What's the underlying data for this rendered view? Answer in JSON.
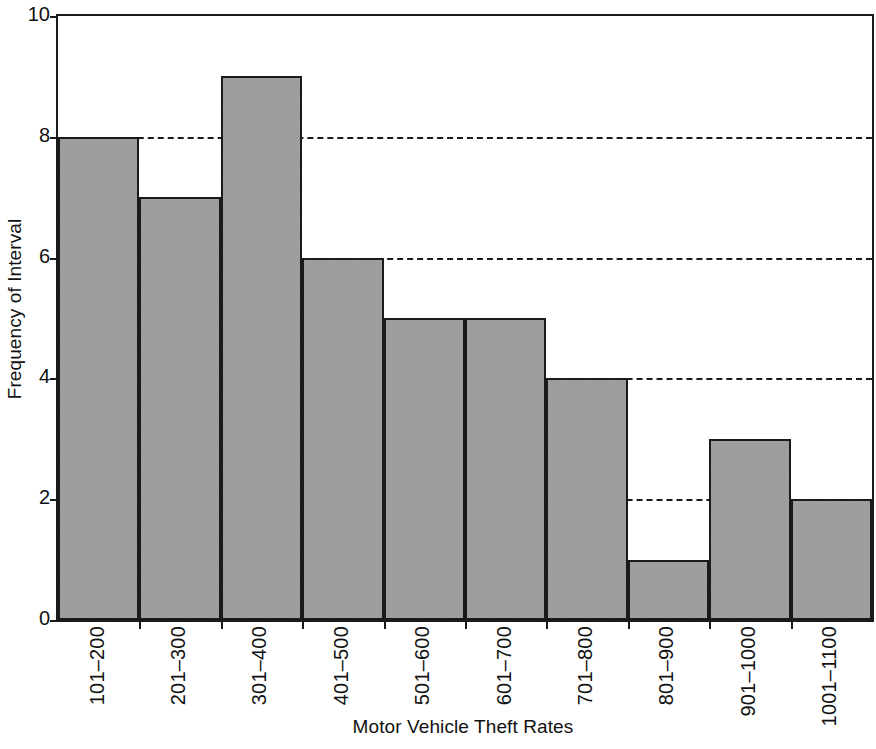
{
  "chart_data": {
    "type": "bar",
    "title": "",
    "subtitle": "",
    "xlabel": "Motor Vehicle Theft Rates",
    "ylabel": "Frequency of Interval",
    "categories": [
      "101–200",
      "201–300",
      "301–400",
      "401–500",
      "501–600",
      "601–700",
      "701–800",
      "801–900",
      "901–1000",
      "1001–1100"
    ],
    "values": [
      8,
      7,
      9,
      6,
      5,
      5,
      4,
      1,
      3,
      2
    ],
    "ylim": [
      0,
      10
    ],
    "yticks": [
      0,
      2,
      4,
      6,
      8,
      10
    ],
    "ytick_labels": [
      "0",
      "2",
      "4",
      "6",
      "8",
      "10"
    ],
    "gridlines_y": [
      2,
      4,
      6,
      8
    ],
    "grid": "horizontal-dashed",
    "legend": "none",
    "bar_gap": 0,
    "colors": {
      "bar_fill": "#9b9b9b",
      "bar_edge": "#1a1a1a",
      "axis": "#1a1a1a",
      "grid": "#1a1a1a",
      "text": "#111111",
      "background": "#ffffff"
    }
  }
}
